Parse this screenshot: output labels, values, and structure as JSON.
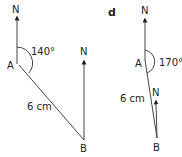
{
  "diagrams": [
    {
      "id": "left",
      "north_a": "N",
      "north_b": "N",
      "point_a": "A",
      "point_b": "B",
      "bearing": "140°",
      "distance": "6 cm"
    },
    {
      "id": "d",
      "part_label": "d",
      "north_a": "N",
      "north_b": "N",
      "point_a": "A",
      "point_b": "B",
      "bearing": "170°",
      "distance": "6 cm"
    }
  ],
  "colors": {
    "line": "#444444",
    "text": "#222222"
  }
}
